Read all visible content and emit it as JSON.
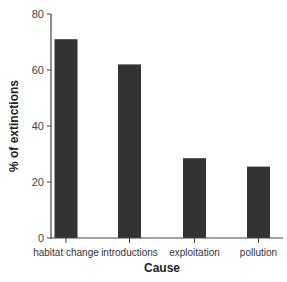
{
  "chart_data": {
    "type": "bar",
    "title": "",
    "xlabel": "Cause",
    "ylabel": "% of extinctions",
    "categories": [
      "habitat change",
      "introductions",
      "exploitation",
      "pollution"
    ],
    "values": [
      71,
      62,
      28.5,
      25.5
    ],
    "ylim": [
      0,
      80
    ],
    "yticks": [
      0,
      20,
      40,
      60,
      80
    ],
    "grid": false,
    "legend": null,
    "bar_color": "#333333"
  }
}
